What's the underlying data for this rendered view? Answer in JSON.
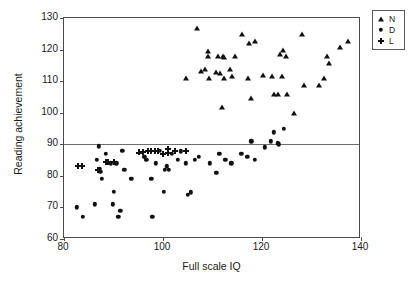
{
  "chart_data": {
    "type": "scatter",
    "title": "",
    "xlabel": "Full scale IQ",
    "ylabel": "Reading achievement",
    "xlim": [
      80,
      140
    ],
    "ylim": [
      60,
      130
    ],
    "xticks": [
      80,
      100,
      120,
      140
    ],
    "yticks": [
      60,
      70,
      80,
      90,
      100,
      110,
      120,
      130
    ],
    "grid": false,
    "legend_position": "top-right",
    "reference_lines": [
      {
        "axis": "y",
        "value": 90,
        "color": "#6e6e6e"
      }
    ],
    "legend": [
      {
        "label": "N",
        "marker": "triangle"
      },
      {
        "label": "D",
        "marker": "circle"
      },
      {
        "label": "L",
        "marker": "plus"
      }
    ],
    "series": [
      {
        "name": "N",
        "marker": "triangle",
        "points": [
          [
            104.6,
            111.0
          ],
          [
            106.8,
            126.8
          ],
          [
            107.6,
            113.1
          ],
          [
            108.4,
            113.8
          ],
          [
            109.0,
            119.7
          ],
          [
            109.1,
            118.0
          ],
          [
            109.2,
            110.9
          ],
          [
            110.8,
            113.0
          ],
          [
            111.2,
            118.0
          ],
          [
            111.6,
            112.7
          ],
          [
            112.1,
            118.0
          ],
          [
            112.3,
            117.6
          ],
          [
            112.3,
            110.9
          ],
          [
            112.0,
            101.8
          ],
          [
            113.6,
            113.8
          ],
          [
            114.0,
            111.7
          ],
          [
            114.5,
            117.9
          ],
          [
            116.0,
            124.8
          ],
          [
            117.2,
            111.0
          ],
          [
            117.4,
            122.0
          ],
          [
            117.8,
            104.8
          ],
          [
            118.6,
            122.7
          ],
          [
            120.2,
            111.8
          ],
          [
            122.0,
            111.6
          ],
          [
            122.5,
            105.9
          ],
          [
            123.2,
            106.0
          ],
          [
            123.6,
            118.7
          ],
          [
            124.0,
            111.7
          ],
          [
            124.2,
            119.9
          ],
          [
            124.8,
            117.9
          ],
          [
            125.0,
            105.9
          ],
          [
            126.4,
            99.8
          ],
          [
            128.0,
            124.8
          ],
          [
            128.4,
            108.9
          ],
          [
            131.6,
            108.9
          ],
          [
            132.6,
            110.9
          ],
          [
            133.2,
            117.9
          ],
          [
            133.6,
            115.8
          ],
          [
            135.8,
            120.7
          ],
          [
            137.4,
            122.8
          ]
        ]
      },
      {
        "name": "D",
        "marker": "circle",
        "points": [
          [
            82.6,
            70.0
          ],
          [
            83.8,
            67.0
          ],
          [
            86.2,
            71.0
          ],
          [
            86.6,
            85.0
          ],
          [
            87.0,
            89.3
          ],
          [
            87.2,
            82.2
          ],
          [
            87.3,
            81.2
          ],
          [
            87.6,
            79.0
          ],
          [
            88.4,
            87.0
          ],
          [
            89.4,
            84.0
          ],
          [
            89.8,
            71.0
          ],
          [
            90.0,
            75.0
          ],
          [
            90.6,
            84.0
          ],
          [
            91.0,
            67.0
          ],
          [
            91.4,
            69.0
          ],
          [
            91.8,
            88.0
          ],
          [
            92.2,
            82.0
          ],
          [
            93.6,
            79.0
          ],
          [
            96.2,
            86.0
          ],
          [
            96.6,
            85.0
          ],
          [
            97.6,
            79.0
          ],
          [
            97.8,
            67.0
          ],
          [
            98.6,
            84.0
          ],
          [
            99.4,
            87.9
          ],
          [
            100.2,
            75.0
          ],
          [
            100.4,
            82.0
          ],
          [
            100.8,
            83.0
          ],
          [
            101.2,
            82.0
          ],
          [
            101.8,
            87.0
          ],
          [
            103.0,
            85.0
          ],
          [
            103.6,
            87.8
          ],
          [
            104.6,
            84.0
          ],
          [
            105.0,
            74.0
          ],
          [
            105.6,
            74.8
          ],
          [
            106.4,
            85.0
          ],
          [
            107.2,
            86.0
          ],
          [
            109.4,
            84.0
          ],
          [
            110.8,
            81.0
          ],
          [
            111.4,
            87.0
          ],
          [
            112.6,
            85.0
          ],
          [
            113.8,
            84.0
          ],
          [
            115.8,
            87.0
          ],
          [
            117.0,
            86.0
          ],
          [
            117.8,
            91.0
          ],
          [
            118.6,
            85.0
          ],
          [
            120.6,
            89.0
          ],
          [
            121.8,
            91.0
          ],
          [
            122.4,
            93.8
          ],
          [
            123.2,
            90.3
          ],
          [
            123.4,
            90.0
          ],
          [
            124.4,
            95.0
          ]
        ]
      },
      {
        "name": "L",
        "marker": "plus",
        "points": [
          [
            82.8,
            83.0
          ],
          [
            83.6,
            83.0
          ],
          [
            86.8,
            82.0
          ],
          [
            88.4,
            84.4
          ],
          [
            88.8,
            84.4
          ],
          [
            90.0,
            84.4
          ],
          [
            95.2,
            87.4
          ],
          [
            96.0,
            87.5
          ],
          [
            97.0,
            88.0
          ],
          [
            97.6,
            88.0
          ],
          [
            98.4,
            88.0
          ],
          [
            99.0,
            87.9
          ],
          [
            100.0,
            87.0
          ],
          [
            101.0,
            88.6
          ],
          [
            101.0,
            87.2
          ],
          [
            102.4,
            88.0
          ],
          [
            104.6,
            88.0
          ]
        ]
      }
    ]
  },
  "axes": {
    "x_tick_labels": [
      "80",
      "100",
      "120",
      "140"
    ],
    "y_tick_labels": [
      "60",
      "70",
      "80",
      "90",
      "100",
      "110",
      "120",
      "130"
    ],
    "x_title": "Full scale IQ",
    "y_title": "Reading achievement"
  },
  "legend": {
    "items": [
      {
        "label": "N"
      },
      {
        "label": "D"
      },
      {
        "label": "L"
      }
    ]
  }
}
